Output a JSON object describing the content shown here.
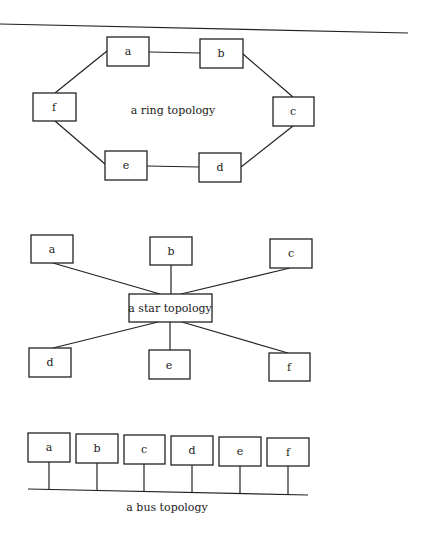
{
  "diagrams": {
    "ring": {
      "caption": "a ring topology",
      "nodes": [
        {
          "id": "a",
          "label": "a"
        },
        {
          "id": "b",
          "label": "b"
        },
        {
          "id": "c",
          "label": "c"
        },
        {
          "id": "d",
          "label": "d"
        },
        {
          "id": "e",
          "label": "e"
        },
        {
          "id": "f",
          "label": "f"
        }
      ],
      "edges": [
        [
          "a",
          "b"
        ],
        [
          "b",
          "c"
        ],
        [
          "c",
          "d"
        ],
        [
          "d",
          "e"
        ],
        [
          "e",
          "f"
        ],
        [
          "f",
          "a"
        ]
      ]
    },
    "star": {
      "hub_label": "a star topology",
      "nodes": [
        {
          "id": "a",
          "label": "a"
        },
        {
          "id": "b",
          "label": "b"
        },
        {
          "id": "c",
          "label": "c"
        },
        {
          "id": "d",
          "label": "d"
        },
        {
          "id": "e",
          "label": "e"
        },
        {
          "id": "f",
          "label": "f"
        }
      ],
      "edges": [
        [
          "hub",
          "a"
        ],
        [
          "hub",
          "b"
        ],
        [
          "hub",
          "c"
        ],
        [
          "hub",
          "d"
        ],
        [
          "hub",
          "e"
        ],
        [
          "hub",
          "f"
        ]
      ]
    },
    "bus": {
      "caption": "a bus topology",
      "nodes": [
        {
          "id": "a",
          "label": "a"
        },
        {
          "id": "b",
          "label": "b"
        },
        {
          "id": "c",
          "label": "c"
        },
        {
          "id": "d",
          "label": "d"
        },
        {
          "id": "e",
          "label": "e"
        },
        {
          "id": "f",
          "label": "f"
        }
      ]
    }
  }
}
